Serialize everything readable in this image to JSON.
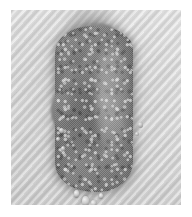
{
  "image": {
    "kind": "micrograph",
    "modality": "brightfield-light-microscopy",
    "color_mode": "grayscale",
    "width_px": 192,
    "height_px": 217,
    "caption": "",
    "alt_text": "Grayscale micrograph of an elongated granular specimen on a diagonally textured light gray field"
  },
  "plate": {
    "background_color": "#d6d6d6",
    "margin_color": "#ffffff",
    "texture": "diagonal-stripe-screen",
    "texture_angle_deg": -48,
    "frame_left_px": 11,
    "frame_top_px": 10,
    "frame_width_px": 170,
    "frame_height_px": 195
  },
  "specimen": {
    "label": "",
    "shape": "elongated-ovoid-clump",
    "orientation": "vertical",
    "surface": "granular-mottled",
    "fill_color": "#7a7a7a",
    "core_color": "#5a5a5a",
    "highlight_color": "#ededed",
    "bounds": {
      "left_px": 58,
      "top_px": 28,
      "width_px": 72,
      "height_px": 162
    },
    "features": [
      {
        "name": "defocus-smear-above",
        "position": "top"
      },
      {
        "name": "hanging-droplets",
        "position": "bottom",
        "count": 4
      },
      {
        "name": "marginal-beads",
        "position": "lateral",
        "count": 5
      }
    ]
  },
  "annotations": {
    "scale_bar_text": "",
    "labels": []
  }
}
